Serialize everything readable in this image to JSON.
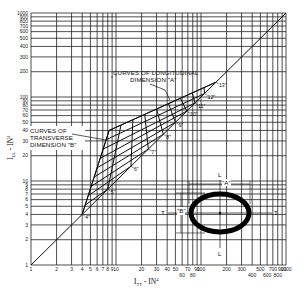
{
  "chart_data": {
    "type": "line",
    "title": "",
    "xlabel": "I_TT - IN^4",
    "ylabel": "I_LL - IN^4",
    "xscale": "log",
    "yscale": "log",
    "xlim": [
      1,
      1000
    ],
    "ylim": [
      1,
      1000
    ],
    "grid": true,
    "x_ticks": [
      "1",
      "2",
      "3",
      "4",
      "5",
      "6",
      "7",
      "8",
      "9",
      "10",
      "20",
      "30",
      "40",
      "50",
      "60",
      "70",
      "80",
      "90",
      "100",
      "200",
      "300",
      "400",
      "500",
      "600",
      "700",
      "800",
      "900",
      "1000"
    ],
    "y_ticks": [
      "1",
      "2",
      "3",
      "4",
      "5",
      "6",
      "7",
      "8",
      "9",
      "10",
      "20",
      "30",
      "40",
      "50",
      "60",
      "70",
      "80",
      "90",
      "100",
      "200",
      "300",
      "400",
      "500",
      "600",
      "700",
      "800",
      "900",
      "1000"
    ],
    "annotations": [
      {
        "text_lines": [
          "CURVES OF LONGITUDINAL",
          "DIMENSION \"A\""
        ]
      },
      {
        "text_lines": [
          "CURVES OF",
          "TRANSVERSE",
          "DIMENSION \"B\""
        ]
      }
    ],
    "series": [
      {
        "name": "I_LL = I_TT reference",
        "x": [
          1,
          1000
        ],
        "y": [
          1,
          1000
        ]
      }
    ],
    "size_labels": [
      {
        "label": "4\"",
        "x": 4,
        "y": 4
      },
      {
        "label": "5\"",
        "x": 8,
        "y": 8
      },
      {
        "label": "6\"",
        "x": 15,
        "y": 15
      },
      {
        "label": "7\"",
        "x": 24,
        "y": 24
      },
      {
        "label": "8\"",
        "x": 36,
        "y": 36
      },
      {
        "label": "9\"",
        "x": 50,
        "y": 50
      },
      {
        "label": "10\"",
        "x": 68,
        "y": 68
      },
      {
        "label": "11\"",
        "x": 85,
        "y": 85
      },
      {
        "label": "12\"",
        "x": 110,
        "y": 110
      },
      {
        "label": "13\"",
        "x": 150,
        "y": 150
      }
    ],
    "inset": {
      "shape": "ellipse",
      "labels": [
        "L",
        "L",
        "T",
        "T",
        "A",
        "B"
      ]
    }
  },
  "labels": {
    "x_axis": "I",
    "x_axis_sub": "TT",
    "x_axis_unit": " - IN",
    "x_axis_exp": "4",
    "y_axis": "I",
    "y_axis_sub": "LL",
    "y_axis_unit": " - IN",
    "y_axis_exp": "4",
    "long_ann_1": "CURVES OF LONGITUDINAL",
    "long_ann_2": "DIMENSION \"A\"",
    "trans_ann_1": "CURVES OF",
    "trans_ann_2": "TRANSVERSE",
    "trans_ann_3": "DIMENSION \"B\"",
    "inset_L_top": "L",
    "inset_L_bottom": "L",
    "inset_T_left": "T",
    "inset_T_right": "T",
    "inset_A": "\"A\"",
    "inset_B": "\"B\""
  }
}
